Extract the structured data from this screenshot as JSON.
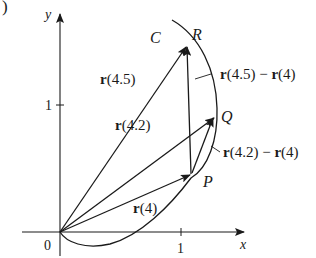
{
  "figure": {
    "panel_marker": ")",
    "axes": {
      "x_label": "x",
      "y_label": "y",
      "origin_label": "0",
      "x_tick_label": "1",
      "y_tick_label": "1"
    },
    "curve_label": "C",
    "points": {
      "P": "P",
      "Q": "Q",
      "R": "R"
    },
    "vectors": {
      "r4": {
        "bold": "r",
        "arg": "(4)"
      },
      "r42": {
        "bold": "r",
        "arg": "(4.2)"
      },
      "r45": {
        "bold": "r",
        "arg": "(4.5)"
      },
      "diff45": {
        "bold1": "r",
        "arg1": "(4.5)",
        "op": " − ",
        "bold2": "r",
        "arg2": "(4)"
      },
      "diff42": {
        "bold1": "r",
        "arg1": "(4.2)",
        "op": " − ",
        "bold2": "r",
        "arg2": "(4)"
      }
    },
    "colors": {
      "ink": "#1a1a1a",
      "background": "#ffffff"
    }
  }
}
